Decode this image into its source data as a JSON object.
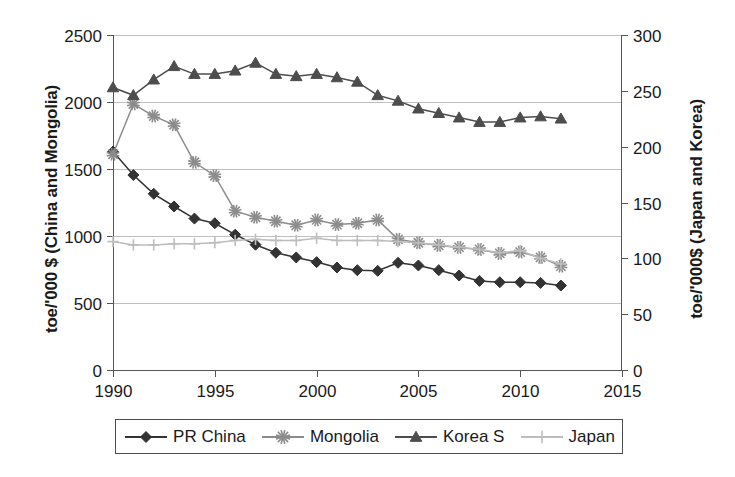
{
  "chart_data": {
    "type": "line",
    "title": "",
    "xlabel": "",
    "ylabel": "toe/'000 $ (China and Mongolia)",
    "ylabel_right": "toe/'000$ (Japan and Korea)",
    "xlim": [
      1990,
      2015
    ],
    "ylim": [
      0,
      2500
    ],
    "ylim_right": [
      0,
      300
    ],
    "xticks": [
      "1990",
      "1995",
      "2000",
      "2005",
      "2010",
      "2015"
    ],
    "xtick_values": [
      1990,
      1995,
      2000,
      2005,
      2010,
      2015
    ],
    "yticks": [
      "0",
      "500",
      "1000",
      "1500",
      "2000",
      "2500"
    ],
    "ytick_values": [
      0,
      500,
      1000,
      1500,
      2000,
      2500
    ],
    "yticks_right": [
      "0",
      "50",
      "100",
      "150",
      "200",
      "250",
      "300"
    ],
    "ytick_values_right": [
      0,
      50,
      100,
      150,
      200,
      250,
      300
    ],
    "grid": true,
    "legend_position": "bottom",
    "x": [
      1990,
      1991,
      1992,
      1993,
      1994,
      1995,
      1996,
      1997,
      1998,
      1999,
      2000,
      2001,
      2002,
      2003,
      2004,
      2005,
      2006,
      2007,
      2008,
      2009,
      2010,
      2011,
      2012
    ],
    "series": [
      {
        "name": "PR China",
        "axis": "left",
        "marker": "diamond",
        "color": "#333333",
        "values": [
          1630,
          1455,
          1315,
          1220,
          1130,
          1095,
          1010,
          935,
          875,
          840,
          805,
          765,
          745,
          740,
          800,
          780,
          745,
          705,
          665,
          655,
          655,
          650,
          630
        ]
      },
      {
        "name": "Mongolia",
        "axis": "left",
        "marker": "asterisk",
        "color": "#8c8c8c",
        "values": [
          1610,
          1985,
          1895,
          1830,
          1550,
          1450,
          1185,
          1140,
          1110,
          1080,
          1120,
          1085,
          1095,
          1120,
          975,
          950,
          930,
          915,
          900,
          870,
          880,
          840,
          775
        ]
      },
      {
        "name": "Korea S",
        "axis": "right",
        "marker": "triangle",
        "color": "#4d4d4d",
        "values": [
          253,
          246,
          260,
          272,
          265,
          265,
          268,
          275,
          265,
          263,
          265,
          262,
          258,
          246,
          241,
          234,
          230,
          226,
          222,
          222,
          226,
          227,
          225
        ]
      },
      {
        "name": "Japan",
        "axis": "right",
        "marker": "plus",
        "color": "#bdbdbd",
        "values": [
          115,
          112,
          112,
          113,
          113,
          114,
          116,
          117,
          116,
          116,
          118,
          116,
          116,
          116,
          115,
          114,
          112,
          110,
          108,
          105,
          107,
          100,
          95
        ]
      }
    ]
  },
  "legend": {
    "items": [
      {
        "label": "PR China",
        "marker": "diamond-icon",
        "color": "#333333"
      },
      {
        "label": "Mongolia",
        "marker": "asterisk-icon",
        "color": "#8c8c8c"
      },
      {
        "label": "Korea S",
        "marker": "triangle-icon",
        "color": "#4d4d4d"
      },
      {
        "label": "Japan",
        "marker": "plus-icon",
        "color": "#bdbdbd"
      }
    ]
  }
}
